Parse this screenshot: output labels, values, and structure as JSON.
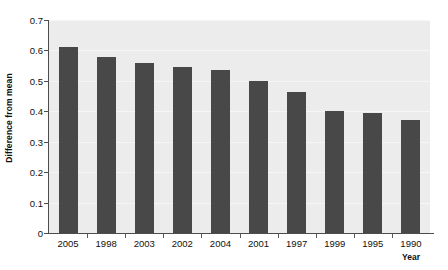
{
  "chart_data": {
    "type": "bar",
    "title": "",
    "subtitle": "",
    "xlabel": "Year",
    "ylabel": "Difference from mean",
    "categories": [
      "2005",
      "1998",
      "2003",
      "2002",
      "2004",
      "2001",
      "1997",
      "1999",
      "1995",
      "1990"
    ],
    "values": [
      0.61,
      0.58,
      0.56,
      0.545,
      0.535,
      0.5,
      0.465,
      0.4,
      0.395,
      0.37
    ],
    "series": [
      {
        "name": "Difference from mean",
        "values": [
          0.61,
          0.58,
          0.56,
          0.545,
          0.535,
          0.5,
          0.465,
          0.4,
          0.395,
          0.37
        ]
      }
    ],
    "ylim": [
      0,
      0.7
    ],
    "yticks": [
      0,
      0.1,
      0.2,
      0.3,
      0.4,
      0.5,
      0.6,
      0.7
    ],
    "ytick_labels": [
      "0",
      "0.1",
      "0.2",
      "0.3",
      "0.4",
      "0.5",
      "0.6",
      "0.7"
    ],
    "grid": true,
    "grid_axis": "y",
    "legend": false,
    "legend_position": "none",
    "bar_color": "#484848",
    "plot_background": "#ececec",
    "figure_background": "#ffffff",
    "axis_color": "#4d4d4d",
    "gridline_color": "#f6f6f6",
    "annotations": []
  }
}
